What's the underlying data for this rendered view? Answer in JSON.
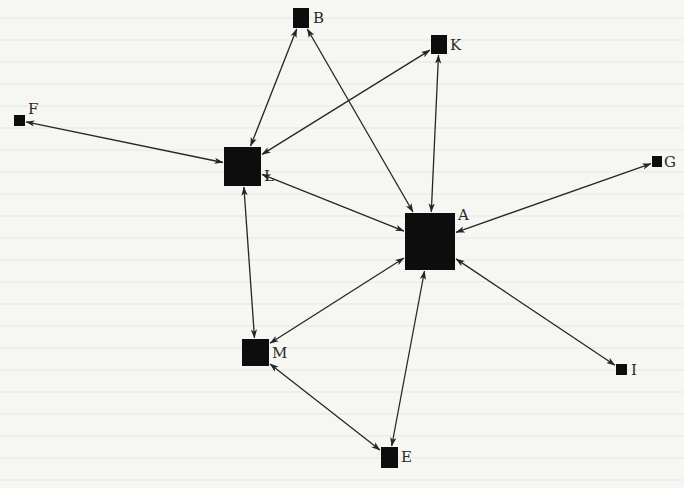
{
  "diagram": {
    "type": "network-graph",
    "directed": true,
    "bidirectional_edges": true,
    "colors": {
      "background": "#f6f6f3",
      "node": "#0d0d0d",
      "edge": "#262626",
      "label": "#2a2a2a"
    },
    "nodes": [
      {
        "id": "A",
        "label": "A",
        "x": 405,
        "y": 213,
        "w": 50,
        "h": 57,
        "label_x": 458,
        "label_y": 220
      },
      {
        "id": "B",
        "label": "B",
        "x": 293,
        "y": 8,
        "w": 16,
        "h": 20,
        "label_x": 313,
        "label_y": 23
      },
      {
        "id": "E",
        "label": "E",
        "x": 381,
        "y": 447,
        "w": 17,
        "h": 21,
        "label_x": 401,
        "label_y": 462
      },
      {
        "id": "F",
        "label": "F",
        "x": 14,
        "y": 115,
        "w": 11,
        "h": 11,
        "label_x": 28,
        "label_y": 114
      },
      {
        "id": "G",
        "label": "G",
        "x": 652,
        "y": 156,
        "w": 10,
        "h": 11,
        "label_x": 664,
        "label_y": 167
      },
      {
        "id": "I",
        "label": "I",
        "x": 616,
        "y": 364,
        "w": 11,
        "h": 11,
        "label_x": 631,
        "label_y": 375
      },
      {
        "id": "K",
        "label": "K",
        "x": 431,
        "y": 35,
        "w": 16,
        "h": 19,
        "label_x": 450,
        "label_y": 50
      },
      {
        "id": "L",
        "label": "L",
        "x": 224,
        "y": 147,
        "w": 37,
        "h": 39,
        "label_x": 264,
        "label_y": 181
      },
      {
        "id": "M",
        "label": "M",
        "x": 242,
        "y": 339,
        "w": 27,
        "h": 27,
        "label_x": 272,
        "label_y": 358
      }
    ],
    "edges": [
      {
        "from": "L",
        "to": "F"
      },
      {
        "from": "L",
        "to": "B"
      },
      {
        "from": "L",
        "to": "K"
      },
      {
        "from": "L",
        "to": "A"
      },
      {
        "from": "L",
        "to": "M"
      },
      {
        "from": "A",
        "to": "B"
      },
      {
        "from": "A",
        "to": "K"
      },
      {
        "from": "A",
        "to": "G"
      },
      {
        "from": "A",
        "to": "I"
      },
      {
        "from": "A",
        "to": "E"
      },
      {
        "from": "A",
        "to": "M"
      },
      {
        "from": "M",
        "to": "E"
      }
    ]
  }
}
